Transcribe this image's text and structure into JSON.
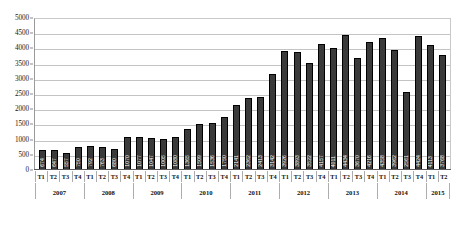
{
  "chart_data": {
    "type": "bar",
    "title": "",
    "subtitle": "",
    "xlabel": "",
    "ylabel": "",
    "ylim": [
      0,
      5000
    ],
    "yticks": [
      5000,
      4500,
      4000,
      3500,
      3000,
      2500,
      2000,
      1500,
      1000,
      500,
      0
    ],
    "ytick_labels": [
      "5000",
      "4500",
      "4000",
      "3500",
      "3000",
      "2500",
      "2000",
      "1500",
      "1000",
      "500",
      "0"
    ],
    "grid": true,
    "legend": false,
    "legend_position": "none",
    "bar_color": "#3a3a3a",
    "bar_border_color": "#000000",
    "gridline_color": "#c4c4c4",
    "axis_color": "#5d5d5d",
    "label_color": "#ffffff",
    "categories": [
      "T1",
      "T2",
      "T3",
      "T4",
      "T1",
      "T2",
      "T3",
      "T4",
      "T1",
      "T2",
      "T3",
      "T4",
      "T1",
      "T2",
      "T3",
      "T4",
      "T1",
      "T2",
      "T3",
      "T4",
      "T1",
      "T2",
      "T3",
      "T4",
      "T1",
      "T2",
      "T3",
      "T4",
      "T1",
      "T2",
      "T3",
      "T4",
      "T1",
      "T2"
    ],
    "values": [
      674,
      647,
      557,
      750,
      792,
      763,
      680,
      1070,
      1077,
      1047,
      1005,
      1080,
      1365,
      1509,
      1536,
      1750,
      2141,
      2362,
      2413,
      3142,
      3926,
      3893,
      3522,
      4157,
      4011,
      4434,
      3670,
      4216,
      4358,
      3962,
      2561,
      4424,
      4113,
      3768
    ],
    "bar_labels": [
      "674",
      "647",
      "557",
      "750",
      "792",
      "763",
      "680",
      "1070",
      "1077",
      "1047",
      "1005",
      "1080",
      "1365",
      "1509",
      "1536",
      "1750",
      "2141",
      "2362",
      "2413",
      "3142",
      "3926",
      "3893",
      "3522",
      "4157",
      "4011",
      "4434",
      "3670",
      "4216",
      "4358",
      "3962",
      "2561",
      "4424",
      "4113",
      "3768"
    ],
    "year_groups": [
      {
        "year": "2007",
        "count": 4
      },
      {
        "year": "2008",
        "count": 4
      },
      {
        "year": "2009",
        "count": 4
      },
      {
        "year": "2010",
        "count": 4
      },
      {
        "year": "2011",
        "count": 4
      },
      {
        "year": "2012",
        "count": 4
      },
      {
        "year": "2013",
        "count": 4
      },
      {
        "year": "2014",
        "count": 4
      },
      {
        "year": "2015",
        "count": 2
      }
    ]
  }
}
